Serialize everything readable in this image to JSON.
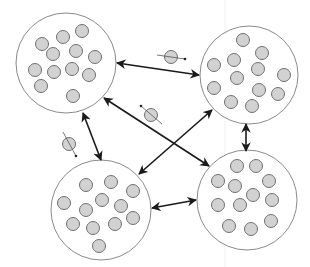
{
  "diagram": {
    "type": "island-model-migration",
    "colors": {
      "background": "#ffffff",
      "island_stroke": "#8a8a8a",
      "island_fill": "#ffffff",
      "ball_fill": "#d2d2d2",
      "ball_stroke": "#707070",
      "arrow": "#1a1a1a",
      "migrant_trail": "#555555"
    },
    "ball_radius": 6.5,
    "islands": [
      {
        "id": "top-left",
        "cx": 66,
        "cy": 63,
        "r": 50,
        "balls": [
          [
            42,
            44
          ],
          [
            63,
            37
          ],
          [
            82,
            31
          ],
          [
            53,
            54
          ],
          [
            76,
            51
          ],
          [
            95,
            57
          ],
          [
            35,
            70
          ],
          [
            54,
            72
          ],
          [
            72,
            69
          ],
          [
            89,
            75
          ],
          [
            41,
            86
          ],
          [
            73,
            96
          ]
        ]
      },
      {
        "id": "top-right",
        "cx": 249,
        "cy": 75,
        "r": 49,
        "balls": [
          [
            243,
            40
          ],
          [
            262,
            53
          ],
          [
            214,
            65
          ],
          [
            234,
            60
          ],
          [
            258,
            69
          ],
          [
            284,
            75
          ],
          [
            237,
            78
          ],
          [
            214,
            88
          ],
          [
            259,
            90
          ],
          [
            278,
            94
          ],
          [
            231,
            102
          ],
          [
            252,
            106
          ]
        ]
      },
      {
        "id": "bottom-left",
        "cx": 101,
        "cy": 210,
        "r": 50,
        "balls": [
          [
            86,
            185
          ],
          [
            111,
            182
          ],
          [
            133,
            191
          ],
          [
            64,
            203
          ],
          [
            102,
            200
          ],
          [
            86,
            210
          ],
          [
            121,
            206
          ],
          [
            73,
            224
          ],
          [
            93,
            228
          ],
          [
            115,
            224
          ],
          [
            133,
            218
          ],
          [
            99,
            246
          ]
        ]
      },
      {
        "id": "bottom-right",
        "cx": 247,
        "cy": 200,
        "r": 50,
        "balls": [
          [
            237,
            166
          ],
          [
            256,
            166
          ],
          [
            218,
            181
          ],
          [
            235,
            186
          ],
          [
            269,
            181
          ],
          [
            253,
            195
          ],
          [
            272,
            200
          ],
          [
            218,
            205
          ],
          [
            240,
            205
          ],
          [
            271,
            221
          ],
          [
            229,
            226
          ],
          [
            251,
            229
          ]
        ]
      }
    ],
    "arrows": [
      {
        "id": "top-left-to-top-right",
        "x1": 117,
        "y1": 63,
        "x2": 199,
        "y2": 75,
        "bidirectional": true
      },
      {
        "id": "top-left-to-bottom-right",
        "x1": 104,
        "y1": 98,
        "x2": 209,
        "y2": 166,
        "bidirectional": true
      },
      {
        "id": "bottom-left-to-top-right",
        "x1": 139,
        "y1": 174,
        "x2": 212,
        "y2": 110,
        "bidirectional": true
      },
      {
        "id": "top-left-to-bottom-left",
        "x1": 83,
        "y1": 113,
        "x2": 101,
        "y2": 160,
        "bidirectional": true
      },
      {
        "id": "top-right-to-bottom-right",
        "x1": 246,
        "y1": 124,
        "x2": 246,
        "y2": 151,
        "bidirectional": true
      },
      {
        "id": "bottom-left-to-bottom-right",
        "x1": 152,
        "y1": 208,
        "x2": 196,
        "y2": 200,
        "bidirectional": true
      }
    ],
    "migrants": [
      {
        "id": "migrant-top",
        "cx": 171,
        "cy": 57,
        "tx1": 157,
        "ty1": 55,
        "tx2": 185,
        "ty2": 59
      },
      {
        "id": "migrant-center",
        "cx": 151,
        "cy": 115,
        "tx1": 162,
        "ty1": 124,
        "tx2": 141,
        "ty2": 106
      },
      {
        "id": "migrant-left",
        "cx": 69,
        "cy": 144,
        "tx1": 63,
        "ty1": 132,
        "tx2": 76,
        "ty2": 156
      }
    ]
  }
}
